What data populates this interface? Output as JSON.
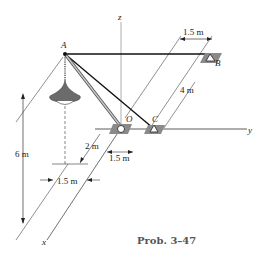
{
  "figure": {
    "caption": "Prob. 3–47",
    "points": {
      "A": "A",
      "B": "B",
      "C": "C",
      "O": "O"
    },
    "axes": {
      "x": "x",
      "y": "y",
      "z": "z"
    },
    "dimensions": {
      "top_width": "1.5 m",
      "right_length": "4 m",
      "height": "6 m",
      "lamp_offset_x": "2 m",
      "base_offset_y": "1.5 m",
      "lamp_offset_y": "1.5 m"
    },
    "colors": {
      "line": "#111111",
      "support": "#7a7a7a",
      "lamp": "#6b6b6b",
      "pole": "#9a9a9a",
      "caption": "#555555"
    }
  }
}
